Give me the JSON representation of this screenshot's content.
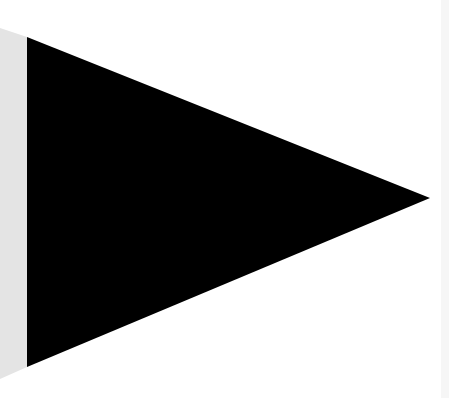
{
  "canvas": {
    "width": 449,
    "height": 398,
    "background": "#ffffff"
  },
  "shapes": {
    "side_strip": {
      "label": "gray side strip",
      "color": "#e4e4e4",
      "points": "0,28 27,37 27,367 0,379"
    },
    "pennant": {
      "label": "black triangle pennant",
      "color": "#000000",
      "points": "27,37 430,198 27,367"
    },
    "right_edge": {
      "label": "faint right edge strip",
      "color": "#f6f6f6",
      "x": 441,
      "width": 8
    }
  }
}
